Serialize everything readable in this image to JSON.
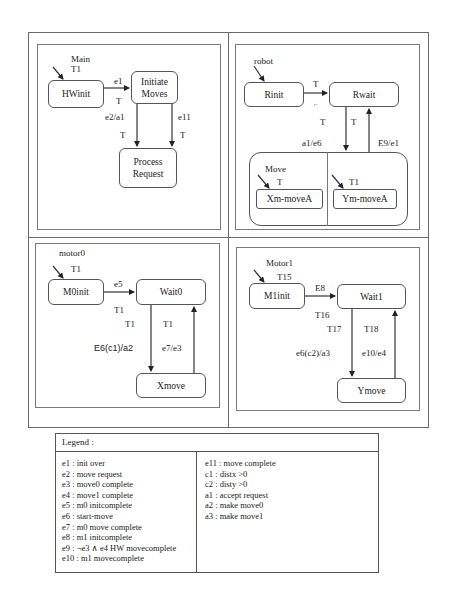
{
  "diagrams": {
    "main": {
      "title": "Main",
      "init_label": "T1",
      "states": {
        "hwinit": "HWinit",
        "initiate_moves": "Initiate Moves",
        "process_request": "Process Request"
      },
      "transitions": {
        "hwinit_to_initiate_event": "e1",
        "hwinit_to_initiate_time": "T",
        "initiate_to_process_left_event": "e2/a1",
        "initiate_to_process_left_time": "T",
        "initiate_to_process_right_event": "e11",
        "initiate_to_process_right_time": "T"
      }
    },
    "robot": {
      "title": "robot",
      "states": {
        "rinit": "Rinit",
        "rwait": "Rwait"
      },
      "transitions": {
        "rinit_to_rwait_time": "T",
        "rinit_to_rwait_mark": "ᴘ",
        "rwait_to_move_time_left": "T",
        "rwait_to_move_time_right": "T",
        "rwait_to_move_event": "a1/e6",
        "move_to_rwait_event": "E9/e1"
      },
      "move": {
        "title": "Move",
        "left_init_label": "T",
        "right_init_label": "T1",
        "left_state": "Xm-moveA",
        "right_state": "Ym-moveA"
      }
    },
    "motor0": {
      "title": "motor0",
      "init_label": "T1",
      "states": {
        "m0init": "M0init",
        "wait0": "Wait0",
        "xmove": "Xmove"
      },
      "transitions": {
        "m0init_to_wait0_event": "e5",
        "m0init_to_wait0_time": "T1",
        "wait0_to_xmove_time": "T1",
        "wait0_to_xmove_event": "E6(c1)/a2",
        "xmove_to_wait0_time": "T1",
        "xmove_to_wait0_event": "e7/e3"
      }
    },
    "motor1": {
      "title": "Motor1",
      "init_label": "T15",
      "states": {
        "m1init": "M1init",
        "wait1": "Wait1",
        "ymove": "Ymove"
      },
      "transitions": {
        "m1init_to_wait1_event": "E8",
        "m1init_to_wait1_time": "T16",
        "wait1_to_ymove_time": "T17",
        "wait1_to_ymove_event": "e6(c2)/a3",
        "ymove_to_wait1_time": "T18",
        "ymove_to_wait1_event": "e10/e4"
      }
    }
  },
  "legend": {
    "title": "Legend :",
    "left": [
      "e1 : init over",
      "e2 : move request",
      "e3 : move0 complete",
      "e4 : move1 complete",
      "e5 : m0 initcomplete",
      "e6 : start-move",
      "e7 : m0 move complete",
      "e8 : m1 initcomplete",
      "e9 : ¬e3 ∧ e4 HW movecomplete",
      "e10 : m1 movecomplete"
    ],
    "right": [
      "e11 : move complete",
      "c1 :  distx >0",
      "c2 : disty >0",
      "a1 :  accept request",
      "a2 : make move0",
      "a3 : make move1"
    ]
  }
}
